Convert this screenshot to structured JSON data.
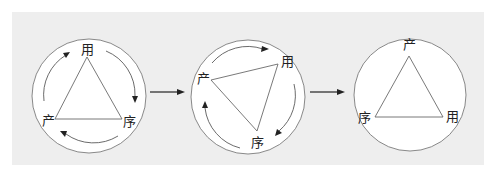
{
  "figure": {
    "background_color": "#eeeeee",
    "stages": [
      {
        "id": "stage-1",
        "labels": {
          "top": "用",
          "bottom_right": "序",
          "bottom_left": "产"
        },
        "rotation_arrows": "clockwise"
      },
      {
        "id": "stage-2",
        "labels": {
          "left": "产",
          "top_right": "用",
          "bottom": "序"
        },
        "rotation_arrows": "clockwise"
      },
      {
        "id": "stage-3",
        "labels": {
          "top": "产",
          "bottom_left": "序",
          "bottom_right": "用"
        },
        "rotation_arrows": "none"
      }
    ],
    "transitions": [
      {
        "from": "stage-1",
        "to": "stage-2",
        "icon": "right-arrow"
      },
      {
        "from": "stage-2",
        "to": "stage-3",
        "icon": "right-arrow"
      }
    ]
  }
}
